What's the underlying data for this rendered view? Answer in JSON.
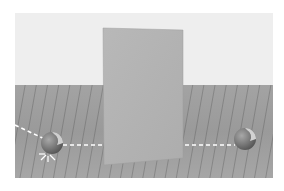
{
  "scene": {
    "description": "3D rendered room: white wall, wooden plank floor, tall gray rectangular panel in center, two spheres on either side connected by dashed paths",
    "colors": {
      "wall": "#eeeeee",
      "floor": "#a0a0a0",
      "panel": "#b4b4b4",
      "sphere": "#7e7e7e",
      "path": "#ffffff"
    },
    "objects": {
      "panel": "gray-panel",
      "left_sphere": "ball",
      "right_sphere": "ball",
      "left_path": "dashed-trajectory",
      "right_path": "dashed-trajectory",
      "impact_marker": "burst"
    }
  }
}
